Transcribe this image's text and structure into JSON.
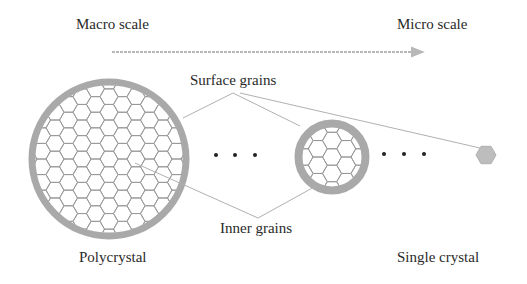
{
  "labels": {
    "macro_scale": "Macro scale",
    "micro_scale": "Micro scale",
    "surface_grains": "Surface grains",
    "inner_grains": "Inner grains",
    "polycrystal": "Polycrystal",
    "single_crystal": "Single crystal"
  },
  "ellipsis": [
    "•",
    "•",
    "•"
  ],
  "colors": {
    "text": "#2a2a2a",
    "arrow": "#b8b8b8",
    "ring": "#a9a9a9",
    "hex_stroke": "#9a9a9a",
    "leader": "#b0b0b0",
    "single_crystal_fill": "#bdbdbd",
    "dot": "#222222"
  },
  "figure": {
    "polycrystal_circle": {
      "cx": 109,
      "cy": 159,
      "r": 80,
      "ring_width": 7
    },
    "intermediate_circle": {
      "cx": 332,
      "cy": 157,
      "r": 37,
      "ring_width": 8
    },
    "single_crystal_hex": {
      "cx": 486,
      "cy": 155,
      "r": 10
    },
    "hex_side_large": 9,
    "hex_side_small": 9.5
  }
}
